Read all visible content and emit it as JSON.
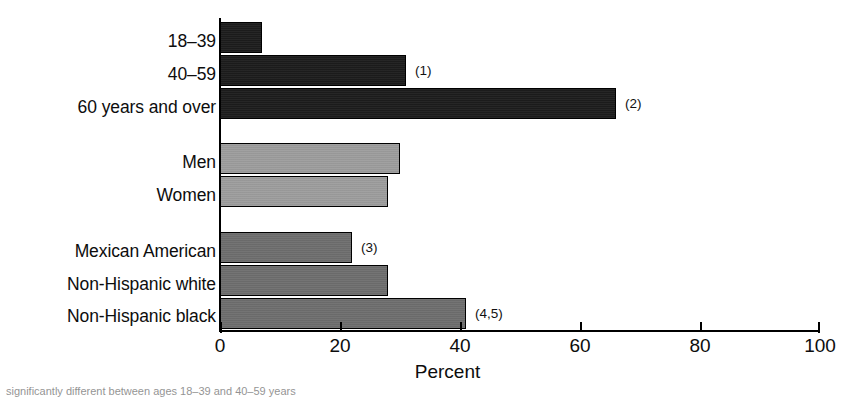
{
  "chart_data": {
    "type": "bar",
    "orientation": "horizontal",
    "title": "",
    "xlabel": "Percent",
    "ylabel": "",
    "xlim": [
      0,
      100
    ],
    "xticks": [
      "0",
      "20",
      "40",
      "60",
      "80",
      "100"
    ],
    "grid": false,
    "legend": "none",
    "groups": [
      {
        "name": "Age",
        "color": "#1c1c1c",
        "items": [
          {
            "category": "18–39",
            "value": 7,
            "note": ""
          },
          {
            "category": "40–59",
            "value": 31,
            "note": "(1)"
          },
          {
            "category": "60 years and over",
            "value": 66,
            "note": "(2)"
          }
        ]
      },
      {
        "name": "Sex",
        "color": "#9d9d9d",
        "items": [
          {
            "category": "Men",
            "value": 30,
            "note": ""
          },
          {
            "category": "Women",
            "value": 28,
            "note": ""
          }
        ]
      },
      {
        "name": "Race and ethnicity",
        "color": "#6e6e6e",
        "items": [
          {
            "category": "Mexican American",
            "value": 22,
            "note": "(3)"
          },
          {
            "category": "Non-Hispanic white",
            "value": 28,
            "note": ""
          },
          {
            "category": "Non-Hispanic black",
            "value": 41,
            "note": "(4,5)"
          }
        ]
      }
    ],
    "categories": [
      "18–39",
      "40–59",
      "60 years and over",
      "Men",
      "Women",
      "Mexican American",
      "Non-Hispanic white",
      "Non-Hispanic black"
    ],
    "values": [
      7,
      31,
      66,
      30,
      28,
      22,
      28,
      41
    ],
    "annotations": [
      "",
      "(1)",
      "(2)",
      "",
      "",
      "(3)",
      "",
      "(4,5)"
    ]
  },
  "axis": {
    "title": "Percent",
    "ticks": [
      {
        "label": "0",
        "value": 0
      },
      {
        "label": "20",
        "value": 20
      },
      {
        "label": "40",
        "value": 40
      },
      {
        "label": "60",
        "value": 60
      },
      {
        "label": "80",
        "value": 80
      },
      {
        "label": "100",
        "value": 100
      }
    ]
  },
  "footnote": {
    "text": "significantly different between ages 18–39 and 40–59 years"
  },
  "colors": {
    "age_bars": "#1c1c1c",
    "sex_bars": "#9d9d9d",
    "race_bars": "#6e6e6e",
    "axis": "#000000",
    "background": "#ffffff"
  }
}
